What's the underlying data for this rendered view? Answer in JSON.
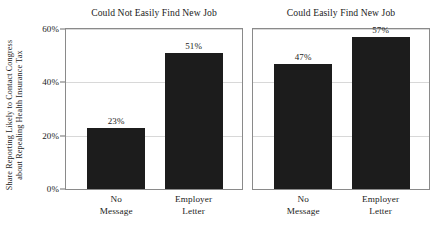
{
  "chart_data": {
    "type": "bar",
    "title": "",
    "xlabel": "",
    "ylabel_line1": "Share Reporting Likely to Contact Congress",
    "ylabel_line2": "about Repealing Health Insurance Tax",
    "ylim": [
      0,
      60
    ],
    "yticks": [
      0,
      20,
      40,
      60
    ],
    "ytick_labels": [
      "0%",
      "20%",
      "40%",
      "60%"
    ],
    "grid": true,
    "legend": "none",
    "categories": [
      "No Message",
      "Employer Letter"
    ],
    "category_lines": [
      [
        "No",
        "Message"
      ],
      [
        "Employer",
        "Letter"
      ]
    ],
    "panels": [
      {
        "title": "Could Not Easily Find New Job",
        "values": [
          23,
          51
        ],
        "value_labels": [
          "23%",
          "51%"
        ]
      },
      {
        "title": "Could Easily Find New Job",
        "values": [
          47,
          57
        ],
        "value_labels": [
          "47%",
          "57%"
        ]
      }
    ],
    "colors": {
      "bar": "#1c1c1c",
      "grid": "#d8d8d8",
      "axis": "#8a8a8a",
      "text": "#1b1b1b",
      "background": "#ffffff"
    }
  }
}
